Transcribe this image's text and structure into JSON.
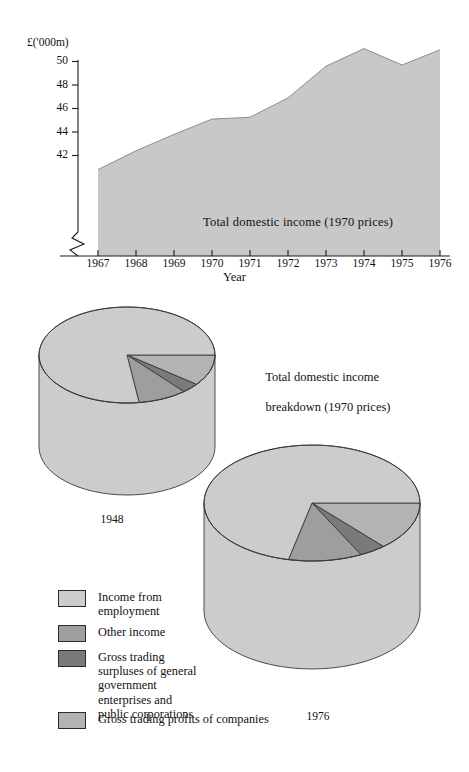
{
  "figure": {
    "background": "#ffffff",
    "ink": "#1a1a1a"
  },
  "chart_data": [
    {
      "type": "area",
      "title": "",
      "series_label": "Total domestic income (1970 prices)",
      "xlabel": "Year",
      "ylabel": "£('000m)",
      "ylabel_note": "axis has a break below the plotted range",
      "axis_break": true,
      "grid": false,
      "legend": "none",
      "x": [
        1967,
        1968,
        1969,
        1970,
        1971,
        1972,
        1973,
        1974,
        1975,
        1976
      ],
      "xtick_labels": [
        "1967",
        "1968",
        "1969",
        "1970",
        "1971",
        "1972",
        "1973",
        "1974",
        "1975",
        "1976"
      ],
      "ytick_labels": [
        "42",
        "44",
        "46",
        "48",
        "50"
      ],
      "ytick_values": [
        42,
        44,
        46,
        48,
        50
      ],
      "ylim": [
        40.6,
        51.3
      ],
      "values": [
        40.8,
        42.4,
        43.8,
        45.1,
        45.25,
        46.9,
        49.6,
        51.1,
        49.7,
        51.0
      ],
      "fill_color": "#c8c8c8",
      "line_color": "#8c8c8c"
    },
    {
      "type": "pie",
      "title": "Total domestic income breakdown (1970 prices)",
      "name": "1948",
      "labels": [
        "Income from employment",
        "Other income",
        "Gross trading surpluses of general government enterprises and public corporations",
        "Gross trading profits of companies"
      ],
      "values": [
        77.2,
        9.0,
        3.3,
        10.5
      ],
      "unit": "percent",
      "colors": [
        "#cccccc",
        "#9e9e9e",
        "#7a7a7a",
        "#b3b3b3"
      ],
      "style": "3d-cylinder"
    },
    {
      "type": "pie",
      "title": "Total domestic income breakdown (1970 prices)",
      "name": "1976",
      "labels": [
        "Income from employment",
        "Other income",
        "Gross trading surpluses of general government enterprises and public corporations",
        "Gross trading profits of companies"
      ],
      "values": [
        71.5,
        11.0,
        4.0,
        13.5
      ],
      "unit": "percent",
      "colors": [
        "#cccccc",
        "#9e9e9e",
        "#7a7a7a",
        "#b3b3b3"
      ],
      "style": "3d-cylinder"
    }
  ],
  "area_chart": {
    "unit_label": "£('000m)",
    "x_axis_title": "Year",
    "series_label": "Total domestic income (1970 prices)",
    "yticks": [
      "50",
      "48",
      "46",
      "44",
      "42"
    ],
    "xticks": [
      "1967",
      "1968",
      "1969",
      "1970",
      "1971",
      "1972",
      "1973",
      "1974",
      "1975",
      "1976"
    ]
  },
  "pies": {
    "section_title_line1": "Total domestic income",
    "section_title_line2": "breakdown (1970 prices)",
    "pie_1948_label": "1948",
    "pie_1976_label": "1976"
  },
  "legend": {
    "items": [
      {
        "label": "Income from\nemployment",
        "color": "#cccccc"
      },
      {
        "label": "Other income",
        "color": "#9e9e9e"
      },
      {
        "label": "Gross trading\nsurpluses of general\ngovernment\nenterprises and\npublic corporations",
        "color": "#7a7a7a"
      },
      {
        "label": "Gross trading profits of companies",
        "color": "#b3b3b3"
      }
    ]
  }
}
